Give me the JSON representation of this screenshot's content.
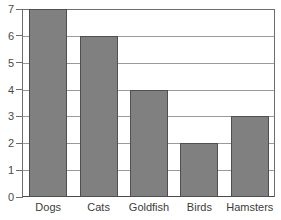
{
  "chart_data": {
    "type": "bar",
    "title": "",
    "subtitle": "",
    "xlabel": "",
    "ylabel": "",
    "categories": [
      "Dogs",
      "Cats",
      "Goldfish",
      "Birds",
      "Hamsters"
    ],
    "values": [
      7,
      6,
      4,
      2,
      3
    ],
    "ylim": [
      0,
      7
    ],
    "yticks": [
      0,
      1,
      2,
      3,
      4,
      5,
      6,
      7
    ],
    "ytick_labels": [
      "0",
      "1",
      "2",
      "3",
      "4",
      "5",
      "6",
      "7"
    ],
    "grid": true,
    "legend": false,
    "legend_position": "none",
    "bar_color": "#808080",
    "bar_edge_color": "#4f4f4f",
    "gridline_color": "#9a9a9a",
    "axis_color": "#6e6e6e",
    "background_color": "#ffffff",
    "text_color": "#3c3c3c"
  }
}
